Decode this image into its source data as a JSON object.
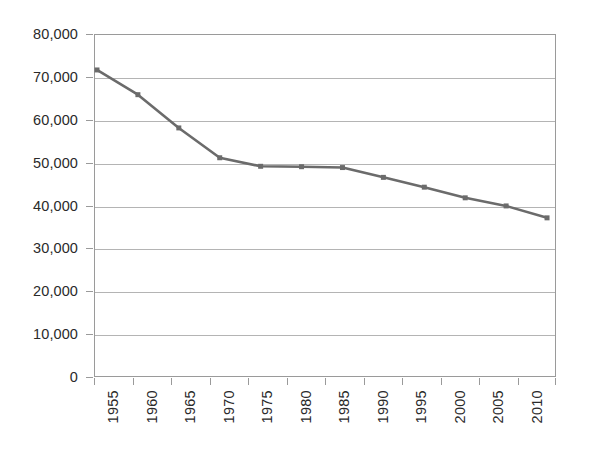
{
  "chart_data": {
    "type": "line",
    "title": "",
    "subtitle": "",
    "xlabel": "",
    "ylabel": "",
    "categories": [
      "1955",
      "1960",
      "1965",
      "1970",
      "1975",
      "1980",
      "1985",
      "1990",
      "1995",
      "2000",
      "2005",
      "2010"
    ],
    "series": [
      {
        "name": "Series 1",
        "values": [
          71800,
          66000,
          58200,
          51200,
          49200,
          49100,
          48900,
          46600,
          44300,
          41800,
          39900,
          37100
        ],
        "color": "#6b6b6b",
        "marker": "square",
        "marker_color": "#6b6b6b"
      }
    ],
    "ylim": [
      0,
      80000
    ],
    "y_ticks": [
      0,
      10000,
      20000,
      30000,
      40000,
      50000,
      60000,
      70000,
      80000
    ],
    "y_tick_labels": [
      "0",
      "10,000",
      "20,000",
      "30,000",
      "40,000",
      "50,000",
      "60,000",
      "70,000",
      "80,000"
    ],
    "x_tick_labels": [
      "1955",
      "1960",
      "1965",
      "1970",
      "1975",
      "1980",
      "1985",
      "1990",
      "1995",
      "2000",
      "2005",
      "2010"
    ],
    "x_label_rotation": 90,
    "grid": true,
    "grid_axis": "y",
    "grid_color": "#b4b4b4",
    "legend": false,
    "legend_position": "none",
    "plot_border_color": "#9a9a9a",
    "background_color": "#ffffff",
    "text_color": "#2a2a2a",
    "annotations": []
  }
}
